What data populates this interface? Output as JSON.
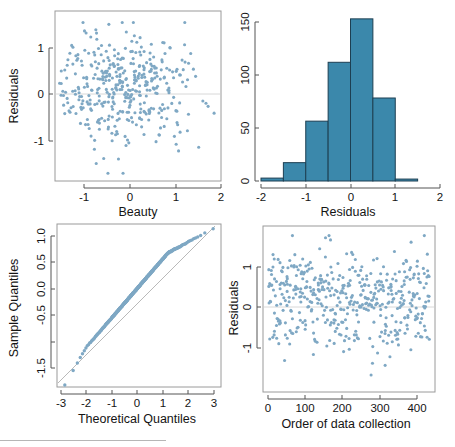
{
  "figure": {
    "name": "regression-diagnostics-2x2",
    "background": "#ffffff",
    "point_color": "#7fa8c4",
    "bar_fill": "#3b88ab",
    "bar_border": "#1d3f52",
    "reference_line_color": "#b9b9b9",
    "axis_color": "#555555",
    "box_color": "#9a9a9a"
  },
  "chart_data": [
    {
      "id": "residuals-vs-beauty",
      "type": "scatter",
      "title": "",
      "xlabel": "Beauty",
      "ylabel": "Residuals",
      "xlim": [
        -1.65,
        2.05
      ],
      "ylim": [
        -1.75,
        1.45
      ],
      "xticks": [
        -1,
        0,
        1,
        2
      ],
      "xticklabels": [
        "-1",
        "0",
        "1",
        "2"
      ],
      "yticks": [
        -1,
        0,
        1
      ],
      "yticklabels": [
        "-1",
        "0",
        "1"
      ],
      "grid": false,
      "hline": 0,
      "legend": "none",
      "n_points": 463,
      "x": [
        -1.54,
        -1.52,
        -1.5,
        -1.48,
        -1.47,
        -1.45,
        -1.44,
        -1.43,
        -1.42,
        -1.41,
        -1.4,
        -1.38,
        -1.36,
        -1.34,
        -1.32,
        -1.3,
        -1.29,
        -1.28,
        -1.27,
        -1.26,
        -1.25,
        -1.24,
        -1.23,
        -1.22,
        -1.21,
        -1.2,
        -1.19,
        -1.18,
        -1.17,
        -1.16,
        -1.15,
        -1.14,
        -1.13,
        -1.12,
        -1.11,
        -1.1,
        -1.09,
        -1.08,
        -1.07,
        -1.06,
        -1.05,
        -1.04,
        -1.03,
        -1.02,
        -1.01,
        -1.0,
        -0.99,
        -0.98,
        -0.97,
        -0.96,
        -0.95,
        -0.94,
        -0.93,
        -0.92,
        -0.91,
        -0.9,
        -0.89,
        -0.88,
        -0.87,
        -0.86,
        -0.85,
        -0.84,
        -0.83,
        -0.82,
        -0.81,
        -0.8,
        -0.79,
        -0.78,
        -0.77,
        -0.76,
        -0.75,
        -0.74,
        -0.73,
        -0.72,
        -0.71,
        -0.7,
        -0.69,
        -0.68,
        -0.67,
        -0.66,
        -0.65,
        -0.64,
        -0.63,
        -0.62,
        -0.61,
        -0.6,
        -0.59,
        -0.58,
        -0.57,
        -0.56,
        -0.55,
        -0.54,
        -0.53,
        -0.52,
        -0.51,
        -0.5,
        -0.49,
        -0.48,
        -0.47,
        -0.46,
        -0.45,
        -0.44,
        -0.43,
        -0.42,
        -0.41,
        -0.4,
        -0.39,
        -0.38,
        -0.37,
        -0.36,
        -0.35,
        -0.34,
        -0.33,
        -0.32,
        -0.31,
        -0.3,
        -0.29,
        -0.28,
        -0.27,
        -0.26,
        -0.25,
        -0.24,
        -0.23,
        -0.22,
        -0.21,
        -0.2,
        -0.19,
        -0.18,
        -0.17,
        -0.16,
        -0.15,
        -0.14,
        -0.13,
        -0.12,
        -0.11,
        -0.1,
        -0.09,
        -0.08,
        -0.07,
        -0.06,
        -0.05,
        -0.04,
        -0.03,
        -0.02,
        -0.01,
        0.0,
        0.01,
        0.02,
        0.03,
        0.04,
        0.05,
        0.06,
        0.07,
        0.08,
        0.09,
        0.1,
        0.11,
        0.12,
        0.13,
        0.14,
        0.15,
        0.16,
        0.17,
        0.18,
        0.19,
        0.2,
        0.21,
        0.22,
        0.23,
        0.24,
        0.25,
        0.26,
        0.27,
        0.28,
        0.29,
        0.3,
        0.31,
        0.32,
        0.33,
        0.34,
        0.35,
        0.36,
        0.37,
        0.38,
        0.39,
        0.4,
        0.41,
        0.42,
        0.43,
        0.44,
        0.45,
        0.46,
        0.47,
        0.48,
        0.49,
        0.5,
        0.51,
        0.52,
        0.53,
        0.54,
        0.55,
        0.56,
        0.57,
        0.58,
        0.59,
        0.6,
        0.61,
        0.62,
        0.63,
        0.64,
        0.65,
        0.66,
        0.67,
        0.68,
        0.69,
        0.7,
        0.72,
        0.74,
        0.76,
        0.78,
        0.8,
        0.82,
        0.84,
        0.86,
        0.88,
        0.9,
        0.92,
        0.94,
        0.96,
        0.98,
        1.0,
        1.02,
        1.04,
        1.06,
        1.08,
        1.1,
        1.12,
        1.14,
        1.16,
        1.18,
        1.2,
        1.22,
        1.24,
        1.26,
        1.28,
        1.3,
        1.35,
        1.4,
        1.45,
        1.5,
        1.55,
        1.6,
        1.65,
        1.7,
        1.72,
        1.74,
        1.76,
        1.78,
        1.8,
        1.85,
        1.9,
        1.95
      ],
      "x_jitter_note": "points cluster in vertical strips at repeated beauty ratings"
    },
    {
      "id": "histogram-of-residuals",
      "type": "bar",
      "title": "",
      "xlabel": "Residuals",
      "ylabel": "",
      "xlim": [
        -2,
        2
      ],
      "ylim": [
        0,
        172
      ],
      "xticks": [
        -2,
        -1,
        0,
        1,
        2
      ],
      "xticklabels": [
        "-2",
        "-1",
        "0",
        "1",
        "2"
      ],
      "yticks": [
        0,
        50,
        100,
        150
      ],
      "yticklabels": [
        "0",
        "50",
        "100",
        "150"
      ],
      "grid": false,
      "legend": "none",
      "bin_width": 0.5,
      "bin_edges": [
        -2.0,
        -1.5,
        -1.0,
        -0.5,
        0.0,
        0.5,
        1.0,
        1.5
      ],
      "categories": [
        "-2.0 to -1.5",
        "-1.5 to -1.0",
        "-1.0 to -0.5",
        "-0.5 to 0.0",
        "0.0 to 0.5",
        "0.5 to 1.0",
        "1.0 to 1.5"
      ],
      "values": [
        3,
        19,
        62,
        123,
        168,
        86,
        2
      ]
    },
    {
      "id": "normal-qq-plot",
      "type": "scatter",
      "title": "",
      "xlabel": "Theoretical Quantiles",
      "ylabel": "Sample Quantiles",
      "xlim": [
        -3.35,
        3.35
      ],
      "ylim": [
        -1.95,
        1.25
      ],
      "xticks": [
        -3,
        -2,
        -1,
        0,
        1,
        2,
        3
      ],
      "xticklabels": [
        "-3",
        "-2",
        "-1",
        "0",
        "1",
        "2",
        "3"
      ],
      "yticks": [
        -1.5,
        -1.0,
        -0.5,
        0.0,
        0.5,
        1.0
      ],
      "yticklabels": [
        "-1.5",
        "-1.0",
        "-0.5",
        "0.0",
        "0.5",
        "1.0"
      ],
      "grid": false,
      "legend": "none",
      "reference_line": {
        "slope": 0.555,
        "intercept": 0.03,
        "style": "straight qq line"
      },
      "n_points": 463,
      "note": "dense near-linear band of points; lower tail falls below the line, upper tail flattens below the line"
    },
    {
      "id": "residuals-vs-order",
      "type": "scatter",
      "title": "",
      "xlabel": "Order of data collection",
      "ylabel": "Residuals",
      "xlim": [
        -12,
        475
      ],
      "ylim": [
        -1.8,
        1.45
      ],
      "xticks": [
        0,
        100,
        200,
        300,
        400
      ],
      "xticklabels": [
        "0",
        "100",
        "200",
        "300",
        "400"
      ],
      "yticks": [
        -1,
        0,
        1
      ],
      "yticklabels": [
        "-1",
        "0",
        "1"
      ],
      "grid": false,
      "hline": 0,
      "legend": "none",
      "n_points": 463
    }
  ]
}
